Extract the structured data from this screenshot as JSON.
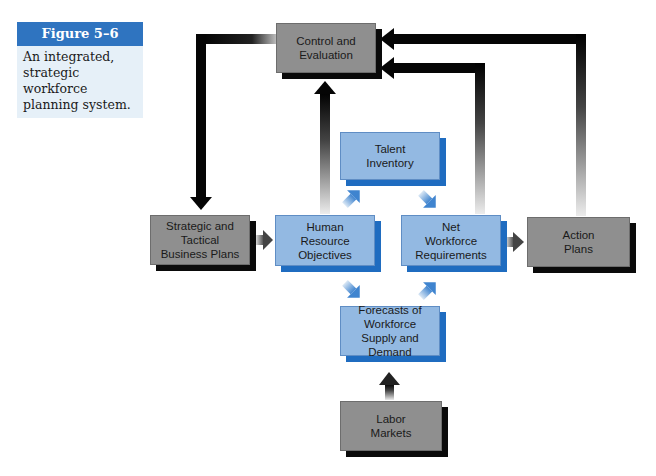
{
  "caption": {
    "figure_label": "Figure 5–6",
    "description": "An integrated, strategic workforce planning system."
  },
  "diagram": {
    "colors": {
      "gray_box": "#8f8f8f",
      "gray_shadow": "#0a0a0a",
      "blue_box": "#93b9e2",
      "blue_shadow": "#1f6cc0",
      "caption_blue": "#2f74c0"
    },
    "nodes": {
      "control": {
        "line1": "Control and",
        "line2": "Evaluation"
      },
      "strategic": {
        "line1": "Strategic and",
        "line2": "Tactical",
        "line3": "Business Plans"
      },
      "hr_objectives": {
        "line1": "Human",
        "line2": "Resource",
        "line3": "Objectives"
      },
      "talent": {
        "line1": "Talent",
        "line2": "Inventory"
      },
      "net_workforce": {
        "line1": "Net",
        "line2": "Workforce",
        "line3": "Requirements"
      },
      "action": {
        "line1": "Action",
        "line2": "Plans"
      },
      "forecasts": {
        "line1": "Forecasts of",
        "line2": "Workforce",
        "line3": "Supply and Demand"
      },
      "labor": {
        "line1": "Labor",
        "line2": "Markets"
      }
    },
    "edges": [
      {
        "from": "Control and Evaluation",
        "to": "Strategic and Tactical Business Plans"
      },
      {
        "from": "Strategic and Tactical Business Plans",
        "to": "Human Resource Objectives"
      },
      {
        "from": "Human Resource Objectives",
        "to": "Control and Evaluation"
      },
      {
        "from": "Human Resource Objectives",
        "to": "Talent Inventory"
      },
      {
        "from": "Human Resource Objectives",
        "to": "Forecasts of Workforce Supply and Demand"
      },
      {
        "from": "Talent Inventory",
        "to": "Net Workforce Requirements"
      },
      {
        "from": "Forecasts of Workforce Supply and Demand",
        "to": "Net Workforce Requirements"
      },
      {
        "from": "Labor Markets",
        "to": "Forecasts of Workforce Supply and Demand"
      },
      {
        "from": "Net Workforce Requirements",
        "to": "Action Plans"
      },
      {
        "from": "Net Workforce Requirements",
        "to": "Control and Evaluation"
      },
      {
        "from": "Action Plans",
        "to": "Control and Evaluation"
      }
    ]
  }
}
